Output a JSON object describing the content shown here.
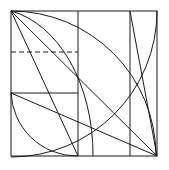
{
  "figure": {
    "canvas": {
      "width": 169,
      "height": 170,
      "background": "#ffffff"
    },
    "stroke_color": "#1a1a1a",
    "stroke_width": 1,
    "dash_pattern": "5,3",
    "square": {
      "name": "outer-square",
      "left": 11,
      "top": 11,
      "right": 157,
      "bottom": 156,
      "width": 146,
      "height": 145
    },
    "vertical_lines": [
      {
        "name": "vertical-line-1",
        "x": 78,
        "y1": 11,
        "y2": 156
      },
      {
        "name": "vertical-line-2",
        "x": 130,
        "y1": 11,
        "y2": 156
      }
    ],
    "horizontal_lines": [
      {
        "name": "dashed-horizontal-line",
        "y": 52,
        "x1": 11,
        "x2": 78,
        "style": "dashed"
      },
      {
        "name": "solid-horizontal-line",
        "y": 93,
        "x1": 11,
        "x2": 78,
        "style": "solid"
      }
    ],
    "arcs": [
      {
        "name": "large-arc-outer",
        "description": "quarter arc centred at top-left corner, radius 146, from top edge right end down to bottom-right",
        "cx": 11,
        "cy": 11,
        "r": 146,
        "start_x": 157,
        "start_y": 11,
        "end_x": 11,
        "end_y": 157
      },
      {
        "name": "mid-arc",
        "description": "arc from top-left corner sweeping to bottom of first vertical line",
        "cx": 11,
        "cy": 156,
        "r": 145,
        "start_x": 11,
        "start_y": 11,
        "end_x": 156,
        "end_y": 156
      },
      {
        "name": "inner-arc",
        "description": "arc from top-left corner curving down to bottom edge near x=78",
        "cx": 11,
        "cy": 156,
        "r": 67,
        "start_x": 11,
        "start_y": 89,
        "end_x": 78,
        "end_y": 156
      },
      {
        "name": "small-arc-bottom-left",
        "description": "small quarter arc from left edge to bottom edge",
        "cx": 11,
        "cy": 156,
        "r": 64,
        "start_x": 11,
        "start_y": 92,
        "end_x": 75,
        "end_y": 156
      }
    ],
    "diagonals": [
      {
        "name": "diagonal-corner-to-corner",
        "x1": 11,
        "y1": 11,
        "x2": 157,
        "y2": 156
      },
      {
        "name": "diagonal-left-to-bottom-right",
        "x1": 11,
        "y1": 93,
        "x2": 157,
        "y2": 156
      },
      {
        "name": "diagonal-steep-to-bottom",
        "x1": 11,
        "y1": 11,
        "x2": 78,
        "y2": 156
      },
      {
        "name": "diagonal-right-panel",
        "x1": 130,
        "y1": 11,
        "x2": 157,
        "y2": 156
      }
    ],
    "key_points": [
      {
        "name": "point-top-left",
        "x": 11,
        "y": 11
      },
      {
        "name": "point-top-right",
        "x": 157,
        "y": 11
      },
      {
        "name": "point-bottom-left",
        "x": 11,
        "y": 156
      },
      {
        "name": "point-bottom-right",
        "x": 157,
        "y": 156
      },
      {
        "name": "point-dashed-meets-vertical-1",
        "x": 78,
        "y": 52
      },
      {
        "name": "point-solid-meets-vertical-1",
        "x": 78,
        "y": 93
      },
      {
        "name": "point-diagonals-cross",
        "x": 78,
        "y": 118
      }
    ]
  }
}
